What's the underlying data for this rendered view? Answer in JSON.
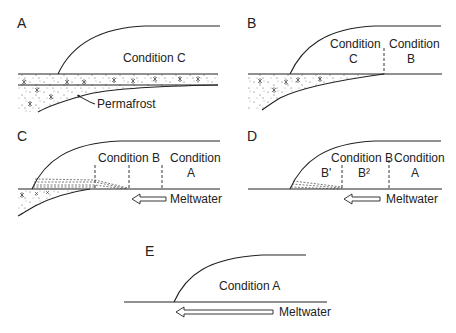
{
  "panels": [
    {
      "id": "A",
      "label": "A",
      "conditions": [
        "Condition C"
      ],
      "annotation": "Permafrost"
    },
    {
      "id": "B",
      "label": "B",
      "conditions": [
        "Condition",
        "C",
        "Condition",
        "B"
      ]
    },
    {
      "id": "C",
      "label": "C",
      "conditions": [
        "Condition B",
        "Condition",
        "A"
      ],
      "arrow_label": "Meltwater"
    },
    {
      "id": "D",
      "label": "D",
      "conditions": [
        "Condition B",
        "Condition",
        "A",
        "B'",
        "B²"
      ],
      "arrow_label": "Meltwater"
    },
    {
      "id": "E",
      "label": "E",
      "conditions": [
        "Condition A"
      ],
      "arrow_label": "Meltwater"
    }
  ]
}
